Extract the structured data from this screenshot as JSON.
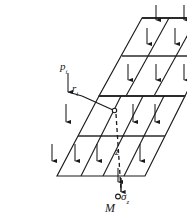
{
  "figure": {
    "type": "engineering-diagram",
    "colors": {
      "line": "#1a1a1a",
      "grid": "#2b2b2b",
      "arrow": "#1a1a1a",
      "background": "#ffffff",
      "dashed": "#1a1a1a"
    }
  },
  "labels": {
    "load_intensity": {
      "symbol": "p",
      "subscript": "i",
      "name": "p_i"
    },
    "radius": {
      "symbol": "r",
      "subscript": "i",
      "name": "r_i"
    },
    "depth": {
      "symbol": "z",
      "subscript": "",
      "name": "z"
    },
    "stress": {
      "symbol": "σ",
      "subscript": "z",
      "name": "sigma_z"
    },
    "point": {
      "symbol": "M",
      "subscript": "",
      "name": "M"
    }
  },
  "geometry": {
    "upper_slab": {
      "columns": 3,
      "rows": 2,
      "outline": "224,18 142,18 99,96 185,96"
    },
    "lower_slab": {
      "columns": 4,
      "rows": 2,
      "outline": "185,96 99,96 57,176 145,176"
    },
    "surface_point": {
      "x": 113,
      "y": 110,
      "marker": "open-circle"
    },
    "field_point": {
      "x": 121,
      "y": 194,
      "marker": "open-circle"
    },
    "depth_line": {
      "x1": 117,
      "y1": 113,
      "x2": 121,
      "y2": 191,
      "style": "dashed"
    }
  },
  "arrows": {
    "direction": "down",
    "count_top_edge": 3,
    "description": "uniform downward pressure arrows over each grid cell"
  }
}
